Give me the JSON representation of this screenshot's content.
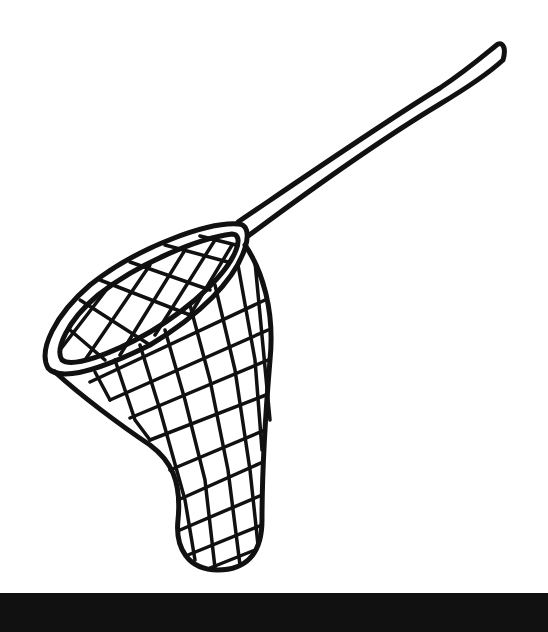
{
  "image": {
    "subject": "Fishing net line drawing",
    "colors": {
      "background": "#ffffff",
      "ink": "#111111",
      "bottom_bar": "#111111"
    }
  }
}
